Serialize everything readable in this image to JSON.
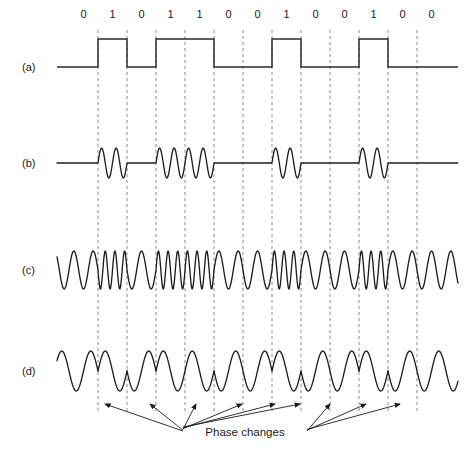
{
  "figure": {
    "title_alt": "Digital modulation waveforms",
    "background": "#ffffff",
    "line_color": "#1f1f1f",
    "grid_color": "#8a8a8a",
    "width": 475,
    "height": 455
  },
  "bits": {
    "label_row_y": 18,
    "sequence": [
      "0",
      "1",
      "0",
      "1",
      "1",
      "0",
      "0",
      "1",
      "0",
      "0",
      "1",
      "0",
      "0"
    ],
    "count": 13,
    "cell_width": 29,
    "first_cell_left": 69
  },
  "rows": [
    {
      "id": "row-a",
      "label": "(a)",
      "name": "digital-signal",
      "baseline_y": 67
    },
    {
      "id": "row-b",
      "label": "(b)",
      "name": "ask-signal",
      "baseline_y": 163
    },
    {
      "id": "row-c",
      "label": "(c)",
      "name": "fsk-signal",
      "baseline_y": 270
    },
    {
      "id": "row-d",
      "label": "(d)",
      "name": "psk-signal",
      "baseline_y": 371
    }
  ],
  "annotation": {
    "text": "Phase changes",
    "text_x": 245,
    "text_y": 436,
    "arrow_targets_left": [
      105,
      150,
      196,
      242,
      275,
      300
    ],
    "arrow_targets_right": [
      330,
      366,
      400
    ]
  },
  "chart_data": {
    "type": "line",
    "xlabel": "",
    "ylabel": "",
    "categories": [
      "0",
      "1",
      "0",
      "1",
      "1",
      "0",
      "0",
      "1",
      "0",
      "0",
      "1",
      "0",
      "0"
    ],
    "series": [
      {
        "name": "(a) digital signal",
        "kind": "square",
        "values": [
          0,
          1,
          0,
          1,
          1,
          0,
          0,
          1,
          0,
          0,
          1,
          0,
          0
        ]
      },
      {
        "name": "(b) ASK",
        "kind": "amplitude-shift-keying",
        "amplitude_per_bit": [
          0,
          1,
          0,
          1,
          1,
          0,
          0,
          1,
          0,
          0,
          1,
          0,
          0
        ],
        "cycles_per_bit": 2
      },
      {
        "name": "(c) FSK",
        "kind": "frequency-shift-keying",
        "cycles_per_bit": [
          1.5,
          3,
          1.5,
          3,
          3,
          1.5,
          1.5,
          3,
          1.5,
          1.5,
          3,
          1.5,
          1.5
        ]
      },
      {
        "name": "(d) PSK",
        "kind": "phase-shift-keying",
        "phase_per_bit_deg": [
          0,
          180,
          0,
          180,
          180,
          0,
          0,
          180,
          0,
          0,
          180,
          0,
          0
        ],
        "cycles_per_bit": 1
      }
    ],
    "grid": true,
    "legend": "none"
  }
}
